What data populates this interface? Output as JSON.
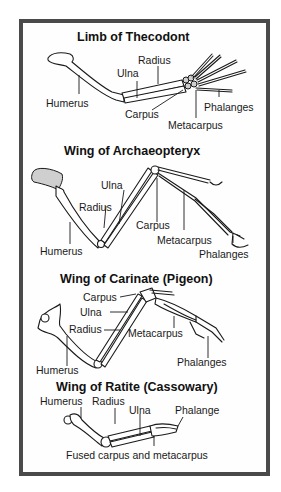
{
  "diagram": {
    "sections": [
      {
        "title": "Limb of Thecodont",
        "labels": {
          "radius": "Radius",
          "ulna": "Ulna",
          "humerus": "Humerus",
          "carpus": "Carpus",
          "phalanges": "Phalanges",
          "metacarpus": "Metacarpus"
        }
      },
      {
        "title": "Wing of Archaeopteryx",
        "labels": {
          "ulna": "Ulna",
          "radius": "Radius",
          "carpus": "Carpus",
          "humerus": "Humerus",
          "metacarpus": "Metacarpus",
          "phalanges": "Phalanges"
        }
      },
      {
        "title": "Wing of Carinate (Pigeon)",
        "labels": {
          "carpus": "Carpus",
          "ulna": "Ulna",
          "radius": "Radius",
          "metacarpus": "Metacarpus",
          "phalanges": "Phalanges",
          "humerus": "Humerus"
        }
      },
      {
        "title": "Wing of Ratite (Cassowary)",
        "labels": {
          "humerus": "Humerus",
          "radius": "Radius",
          "ulna": "Ulna",
          "phalange": "Phalange",
          "fused": "Fused carpus and metacarpus"
        }
      }
    ],
    "colors": {
      "frame_border": "#4a4a4a",
      "ink": "#1a1a1a",
      "background": "#ffffff"
    }
  }
}
